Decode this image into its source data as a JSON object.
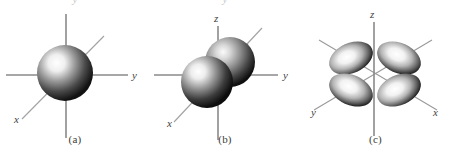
{
  "figure": {
    "background_color": "#ffffff",
    "axis_color": "#8a8a8a",
    "label_color": "#3f3f3f",
    "caption_color": "#3b3b3b",
    "orbital_dark": "#1c1c1c",
    "orbital_mid": "#6e6e6e",
    "orbital_light": "#ffffff"
  },
  "panels": [
    {
      "id": "a",
      "caption": "(a)",
      "orbital_type": "s",
      "shape": "single-sphere",
      "lobe_count": 1,
      "axes": [
        {
          "name": "y",
          "label": "y",
          "direction": "right",
          "label_x": 132,
          "label_y": 78
        },
        {
          "name": "z",
          "label": "",
          "direction": "vertical",
          "label_x": 66,
          "label_y": 14
        },
        {
          "name": "x",
          "label": "x",
          "direction": "diagonal-lower-left",
          "label_x": 14,
          "label_y": 122
        }
      ],
      "cropped_text_above": "y"
    },
    {
      "id": "b",
      "caption": "(b)",
      "orbital_type": "p",
      "shape": "two-lobe-spheres",
      "lobe_count": 2,
      "axes": [
        {
          "name": "y",
          "label": "y",
          "direction": "right",
          "label_x": 133,
          "label_y": 78
        },
        {
          "name": "z",
          "label": "z",
          "direction": "vertical",
          "label_x": 68,
          "label_y": 22
        },
        {
          "name": "x",
          "label": "x",
          "direction": "diagonal-lower-left",
          "label_x": 17,
          "label_y": 126
        }
      ],
      "cropped_text_above": "y"
    },
    {
      "id": "c",
      "caption": "(c)",
      "orbital_type": "d",
      "shape": "four-lobe-clover",
      "lobe_count": 4,
      "axes": [
        {
          "name": "z",
          "label": "z",
          "direction": "vertical",
          "label_x": 73,
          "label_y": 18
        },
        {
          "name": "x",
          "label": "x",
          "direction": "diagonal-lower-right",
          "label_x": 133,
          "label_y": 112
        },
        {
          "name": "y",
          "label": "y",
          "direction": "diagonal-lower-left",
          "label_x": 13,
          "label_y": 112
        }
      ],
      "cropped_text_above": ""
    }
  ]
}
